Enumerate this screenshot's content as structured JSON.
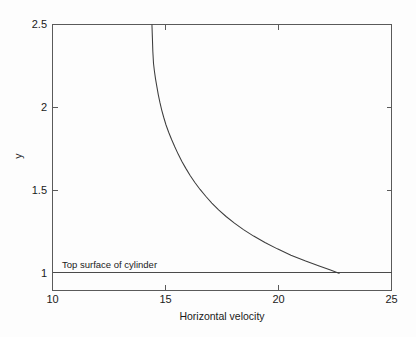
{
  "figure": {
    "background_color": "#fdfdfd",
    "axis_color": "#5a5a5a",
    "curve_color": "#3d3d3d"
  },
  "chart_data": {
    "type": "line",
    "title": "",
    "subtitle": "",
    "xlabel": "Horizontal velocity",
    "ylabel": "y",
    "xlim": [
      10,
      25
    ],
    "ylim": [
      0.9,
      2.5
    ],
    "xticks": [
      10,
      15,
      20,
      25
    ],
    "xtick_labels": [
      "10",
      "15",
      "20",
      "25"
    ],
    "yticks": [
      1,
      1.5,
      2,
      2.5
    ],
    "ytick_labels": [
      "1",
      "1.5",
      "2",
      "2.5"
    ],
    "grid": false,
    "legend": null,
    "legend_position": "none",
    "box_frame": true,
    "series": [
      {
        "name": "velocity profile",
        "x": [
          22.7,
          22.3,
          21.8,
          21.2,
          20.55,
          19.95,
          19.4,
          18.9,
          18.45,
          18.05,
          17.68,
          17.35,
          17.05,
          16.78,
          16.53,
          16.3,
          16.09,
          15.9,
          15.72,
          15.56,
          15.41,
          15.27,
          15.14,
          15.02,
          14.92,
          14.83,
          14.75,
          14.68,
          14.62,
          14.56,
          14.51,
          14.47,
          14.44,
          14.42,
          14.4
        ],
        "y": [
          1.0,
          1.02,
          1.045,
          1.075,
          1.11,
          1.148,
          1.186,
          1.225,
          1.264,
          1.303,
          1.343,
          1.383,
          1.424,
          1.465,
          1.506,
          1.548,
          1.59,
          1.633,
          1.676,
          1.719,
          1.763,
          1.807,
          1.851,
          1.896,
          1.941,
          1.986,
          2.032,
          2.078,
          2.124,
          2.171,
          2.218,
          2.265,
          2.337,
          2.42,
          2.5
        ]
      }
    ],
    "annotations": [
      {
        "name": "top-surface-of-cylinder",
        "text": "Top surface of cylinder",
        "x": 10.4,
        "y": 1.06
      }
    ],
    "reference_lines": [
      {
        "name": "cylinder-top-surface",
        "orientation": "horizontal",
        "value": 1.0
      }
    ]
  }
}
